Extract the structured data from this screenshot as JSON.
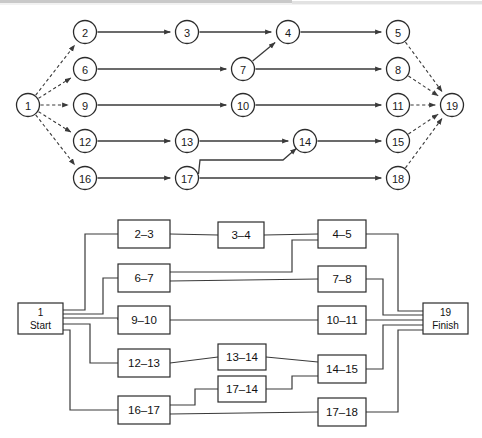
{
  "figure": {
    "title": "",
    "panels": [
      {
        "name": "activity-on-arrow-network",
        "caption": ""
      },
      {
        "name": "precedence-box-network",
        "caption": ""
      }
    ]
  },
  "chart_data": {
    "type": "diagram",
    "title": "",
    "subtitle": "",
    "xlabel": "",
    "ylabel": "",
    "panels": [
      {
        "id": "network-nodes",
        "kind": "node-arrow-network",
        "nodes": [
          {
            "id": "1",
            "label": "1",
            "x": 28,
            "y": 105
          },
          {
            "id": "2",
            "label": "2",
            "x": 85,
            "y": 32
          },
          {
            "id": "3",
            "label": "3",
            "x": 187,
            "y": 32
          },
          {
            "id": "4",
            "label": "4",
            "x": 288,
            "y": 32
          },
          {
            "id": "5",
            "label": "5",
            "x": 398,
            "y": 32
          },
          {
            "id": "6",
            "label": "6",
            "x": 85,
            "y": 69
          },
          {
            "id": "7",
            "label": "7",
            "x": 243,
            "y": 69
          },
          {
            "id": "8",
            "label": "8",
            "x": 398,
            "y": 69
          },
          {
            "id": "9",
            "label": "9",
            "x": 85,
            "y": 105
          },
          {
            "id": "10",
            "label": "10",
            "x": 243,
            "y": 105
          },
          {
            "id": "11",
            "label": "11",
            "x": 398,
            "y": 105
          },
          {
            "id": "12",
            "label": "12",
            "x": 85,
            "y": 141
          },
          {
            "id": "13",
            "label": "13",
            "x": 187,
            "y": 141
          },
          {
            "id": "14",
            "label": "14",
            "x": 305,
            "y": 141
          },
          {
            "id": "15",
            "label": "15",
            "x": 398,
            "y": 141
          },
          {
            "id": "16",
            "label": "16",
            "x": 85,
            "y": 178
          },
          {
            "id": "17",
            "label": "17",
            "x": 187,
            "y": 178
          },
          {
            "id": "18",
            "label": "18",
            "x": 398,
            "y": 178
          },
          {
            "id": "19",
            "label": "19",
            "x": 452,
            "y": 105
          }
        ],
        "edges": [
          {
            "from": "1",
            "to": "2",
            "style": "dashed"
          },
          {
            "from": "1",
            "to": "6",
            "style": "dashed"
          },
          {
            "from": "1",
            "to": "9",
            "style": "dashed"
          },
          {
            "from": "1",
            "to": "12",
            "style": "dashed"
          },
          {
            "from": "1",
            "to": "16",
            "style": "dashed"
          },
          {
            "from": "2",
            "to": "3",
            "style": "solid"
          },
          {
            "from": "3",
            "to": "4",
            "style": "solid"
          },
          {
            "from": "4",
            "to": "5",
            "style": "solid"
          },
          {
            "from": "6",
            "to": "7",
            "style": "solid"
          },
          {
            "from": "7",
            "to": "4",
            "style": "solid"
          },
          {
            "from": "7",
            "to": "8",
            "style": "solid"
          },
          {
            "from": "9",
            "to": "10",
            "style": "solid"
          },
          {
            "from": "10",
            "to": "11",
            "style": "solid"
          },
          {
            "from": "12",
            "to": "13",
            "style": "solid"
          },
          {
            "from": "13",
            "to": "14",
            "style": "solid"
          },
          {
            "from": "14",
            "to": "15",
            "style": "solid"
          },
          {
            "from": "16",
            "to": "17",
            "style": "solid"
          },
          {
            "from": "17",
            "to": "14",
            "style": "solid-elbow"
          },
          {
            "from": "17",
            "to": "18",
            "style": "solid"
          },
          {
            "from": "5",
            "to": "19",
            "style": "dashed"
          },
          {
            "from": "8",
            "to": "19",
            "style": "dashed"
          },
          {
            "from": "11",
            "to": "19",
            "style": "dashed"
          },
          {
            "from": "15",
            "to": "19",
            "style": "dashed"
          },
          {
            "from": "18",
            "to": "19",
            "style": "dashed"
          }
        ]
      },
      {
        "id": "network-boxes",
        "kind": "precedence-box-network",
        "boxes": [
          {
            "id": "start",
            "lines": [
              "1",
              "Start"
            ],
            "x": 18,
            "y": 303,
            "w": 45,
            "h": 31
          },
          {
            "id": "b2_3",
            "lines": [
              "2–3"
            ],
            "x": 118,
            "y": 220,
            "w": 52,
            "h": 28
          },
          {
            "id": "b3_4",
            "lines": [
              "3–4"
            ],
            "x": 218,
            "y": 222,
            "w": 46,
            "h": 26
          },
          {
            "id": "b4_5",
            "lines": [
              "4–5"
            ],
            "x": 318,
            "y": 220,
            "w": 48,
            "h": 28
          },
          {
            "id": "b6_7",
            "lines": [
              "6–7"
            ],
            "x": 118,
            "y": 264,
            "w": 52,
            "h": 28
          },
          {
            "id": "b7_8",
            "lines": [
              "7–8"
            ],
            "x": 318,
            "y": 266,
            "w": 48,
            "h": 26
          },
          {
            "id": "b9_10",
            "lines": [
              "9–10"
            ],
            "x": 118,
            "y": 306,
            "w": 52,
            "h": 28
          },
          {
            "id": "b10_11",
            "lines": [
              "10–11"
            ],
            "x": 318,
            "y": 306,
            "w": 48,
            "h": 28
          },
          {
            "id": "b12_13",
            "lines": [
              "12–13"
            ],
            "x": 118,
            "y": 349,
            "w": 52,
            "h": 28
          },
          {
            "id": "b13_14",
            "lines": [
              "13–14"
            ],
            "x": 218,
            "y": 344,
            "w": 48,
            "h": 26
          },
          {
            "id": "b14_15",
            "lines": [
              "14–15"
            ],
            "x": 318,
            "y": 355,
            "w": 48,
            "h": 28
          },
          {
            "id": "b17_14",
            "lines": [
              "17–14"
            ],
            "x": 218,
            "y": 376,
            "w": 48,
            "h": 26
          },
          {
            "id": "b16_17",
            "lines": [
              "16–17"
            ],
            "x": 118,
            "y": 396,
            "w": 52,
            "h": 28
          },
          {
            "id": "b17_18",
            "lines": [
              "17–18"
            ],
            "x": 318,
            "y": 398,
            "w": 48,
            "h": 28
          },
          {
            "id": "finish",
            "lines": [
              "19",
              "Finish"
            ],
            "x": 423,
            "y": 303,
            "w": 45,
            "h": 31
          }
        ],
        "links": [
          {
            "from": "start",
            "to": "b2_3"
          },
          {
            "from": "start",
            "to": "b6_7"
          },
          {
            "from": "start",
            "to": "b9_10"
          },
          {
            "from": "start",
            "to": "b12_13"
          },
          {
            "from": "start",
            "to": "b16_17"
          },
          {
            "from": "b2_3",
            "to": "b3_4"
          },
          {
            "from": "b3_4",
            "to": "b4_5"
          },
          {
            "from": "b6_7",
            "to": "b4_5"
          },
          {
            "from": "b6_7",
            "to": "b7_8"
          },
          {
            "from": "b9_10",
            "to": "b10_11"
          },
          {
            "from": "b12_13",
            "to": "b13_14"
          },
          {
            "from": "b13_14",
            "to": "b14_15"
          },
          {
            "from": "b16_17",
            "to": "b17_14"
          },
          {
            "from": "b17_14",
            "to": "b14_15"
          },
          {
            "from": "b16_17",
            "to": "b17_18"
          },
          {
            "from": "b4_5",
            "to": "finish"
          },
          {
            "from": "b7_8",
            "to": "finish"
          },
          {
            "from": "b10_11",
            "to": "finish"
          },
          {
            "from": "b14_15",
            "to": "finish"
          },
          {
            "from": "b17_18",
            "to": "finish"
          }
        ]
      }
    ],
    "legend": [],
    "annotations": [],
    "colors": {
      "stroke": "#2b2b2b",
      "line": "#3a3a3a",
      "background": "#ffffff",
      "band": "#c9c9c9"
    }
  }
}
